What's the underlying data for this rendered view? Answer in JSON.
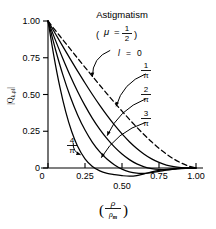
{
  "chart_data": {
    "type": "line",
    "title": "Astigmatism",
    "subtitle": "(μ = 1/2)",
    "subtitle_mu": "μ",
    "subtitle_eq": "=",
    "subtitle_num": "1",
    "subtitle_den": "2",
    "xlabel": "(ρ/ρm)",
    "xlabel_num": "ρ",
    "xlabel_den": "ρm",
    "xlabel_den_base": "ρ",
    "xlabel_den_sub": "m",
    "ylabel": "|Q k,ρ l|",
    "ylabel_main": "|Q",
    "ylabel_sub": "k,ρl",
    "ylabel_close": "|",
    "xlim": [
      0,
      1.08
    ],
    "ylim": [
      -0.09,
      1.05
    ],
    "xticks": [
      0,
      0.25,
      0.5,
      0.75,
      1.0
    ],
    "xticklabels": [
      "0",
      "0.25",
      "0.50",
      "0.75",
      "1.00"
    ],
    "yticks": [
      0,
      0.25,
      0.5,
      0.75,
      1.0
    ],
    "yticklabels": [
      "0",
      "0.25",
      "0.50",
      "0.75",
      "1.00"
    ],
    "grid": false,
    "legend": "inline-annotations",
    "legend_prefix": "l",
    "legend_eq": "=",
    "series": [
      {
        "name": "l = 0",
        "label_text": "0",
        "label_type": "plain",
        "style": "dashed",
        "x": [
          0.0,
          0.05,
          0.1,
          0.15,
          0.2,
          0.25,
          0.3,
          0.35,
          0.4,
          0.45,
          0.5,
          0.55,
          0.6,
          0.65,
          0.7,
          0.75,
          0.8,
          0.85,
          0.9,
          0.95,
          1.0
        ],
        "y": [
          1.0,
          0.936,
          0.873,
          0.81,
          0.747,
          0.685,
          0.624,
          0.563,
          0.503,
          0.444,
          0.387,
          0.331,
          0.277,
          0.226,
          0.178,
          0.134,
          0.095,
          0.061,
          0.034,
          0.013,
          0.0
        ]
      },
      {
        "name": "l = 1/π",
        "label_num": "1",
        "label_den": "π",
        "label_type": "fraction",
        "style": "solid",
        "x": [
          0.0,
          0.05,
          0.1,
          0.15,
          0.2,
          0.25,
          0.3,
          0.35,
          0.4,
          0.45,
          0.5,
          0.55,
          0.6,
          0.65,
          0.7,
          0.75,
          0.8,
          0.85,
          0.9,
          0.95,
          1.0
        ],
        "y": [
          1.0,
          0.913,
          0.827,
          0.742,
          0.659,
          0.578,
          0.5,
          0.426,
          0.356,
          0.291,
          0.232,
          0.179,
          0.133,
          0.094,
          0.062,
          0.038,
          0.02,
          0.009,
          0.003,
          0.0,
          0.0
        ]
      },
      {
        "name": "l = 2/π",
        "label_num": "2",
        "label_den": "π",
        "label_type": "fraction",
        "style": "solid",
        "x": [
          0.0,
          0.05,
          0.1,
          0.15,
          0.2,
          0.25,
          0.3,
          0.35,
          0.4,
          0.45,
          0.5,
          0.55,
          0.6,
          0.65,
          0.7,
          0.75,
          0.8,
          0.85,
          0.9,
          0.95,
          1.0
        ],
        "y": [
          1.0,
          0.87,
          0.745,
          0.628,
          0.521,
          0.424,
          0.338,
          0.263,
          0.198,
          0.142,
          0.095,
          0.057,
          0.028,
          0.008,
          -0.004,
          -0.01,
          -0.011,
          -0.008,
          -0.004,
          -0.001,
          0.0
        ]
      },
      {
        "name": "l = 3/π",
        "label_num": "3",
        "label_den": "π",
        "label_type": "fraction",
        "style": "solid",
        "x": [
          0.0,
          0.05,
          0.1,
          0.15,
          0.2,
          0.25,
          0.3,
          0.35,
          0.4,
          0.45,
          0.5,
          0.55,
          0.6,
          0.65,
          0.7,
          0.75,
          0.8,
          0.85,
          0.9,
          0.95,
          1.0
        ],
        "y": [
          1.0,
          0.808,
          0.635,
          0.486,
          0.361,
          0.258,
          0.175,
          0.11,
          0.059,
          0.021,
          -0.008,
          -0.026,
          -0.035,
          -0.036,
          -0.031,
          -0.023,
          -0.014,
          -0.007,
          -0.002,
          0.0,
          0.0
        ]
      },
      {
        "name": "l = 4/π",
        "label_num": "4",
        "label_den": "π",
        "label_type": "fraction",
        "style": "solid",
        "x": [
          0.0,
          0.04,
          0.08,
          0.12,
          0.16,
          0.2,
          0.25,
          0.3,
          0.35,
          0.4,
          0.45,
          0.5,
          0.55,
          0.6,
          0.65,
          0.7,
          0.75,
          0.8,
          0.85,
          0.9,
          0.95,
          1.0
        ],
        "y": [
          1.0,
          0.76,
          0.552,
          0.382,
          0.248,
          0.148,
          0.062,
          0.01,
          -0.02,
          -0.036,
          -0.045,
          -0.052,
          -0.056,
          -0.052,
          -0.04,
          -0.027,
          -0.016,
          -0.009,
          -0.004,
          -0.001,
          0.0,
          0.0
        ]
      }
    ],
    "annotations": [
      {
        "label": "l = 0",
        "arrow_from": [
          0.42,
          0.8
        ],
        "arrow_to": [
          0.3,
          0.62
        ]
      },
      {
        "label": "1/π",
        "arrow_from": [
          0.66,
          0.64
        ],
        "arrow_to": [
          0.46,
          0.42
        ]
      },
      {
        "label": "2/π",
        "arrow_from": [
          0.66,
          0.47
        ],
        "arrow_to": [
          0.4,
          0.22
        ]
      },
      {
        "label": "3/π",
        "arrow_from": [
          0.66,
          0.31
        ],
        "arrow_to": [
          0.36,
          0.07
        ]
      },
      {
        "label": "4/π",
        "arrow_from": [
          0.17,
          0.17
        ],
        "arrow_to": [
          0.22,
          0.09
        ]
      }
    ]
  }
}
